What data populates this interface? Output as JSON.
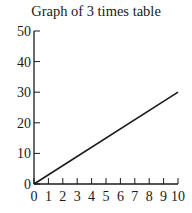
{
  "chart_data": {
    "type": "line",
    "title": "Graph of 3 times table",
    "xlabel": "",
    "ylabel": "",
    "x_ticks": [
      "0",
      "1",
      "2",
      "3",
      "4",
      "5",
      "6",
      "7",
      "8",
      "9",
      "10"
    ],
    "y_ticks": [
      "0",
      "10",
      "20",
      "30",
      "40",
      "50"
    ],
    "xlim": [
      0,
      10
    ],
    "ylim": [
      0,
      50
    ],
    "grid": false,
    "legend": null,
    "series": [
      {
        "name": "3 times table",
        "x": [
          0,
          10
        ],
        "y": [
          0,
          30
        ]
      }
    ],
    "colors": {
      "line": "#1a1a1a",
      "axis": "#1a1a1a"
    }
  }
}
